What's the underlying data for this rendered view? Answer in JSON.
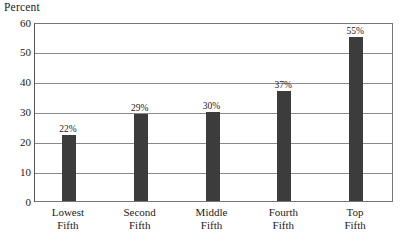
{
  "chart_data": {
    "type": "bar",
    "title": "",
    "ylabel": "Percent",
    "xlabel": "",
    "categories": [
      "Lowest Fifth",
      "Second Fifth",
      "Middle Fifth",
      "Fourth Fifth",
      "Top Fifth"
    ],
    "category_lines": [
      [
        "Lowest",
        "Fifth"
      ],
      [
        "Second",
        "Fifth"
      ],
      [
        "Middle",
        "Fifth"
      ],
      [
        "Fourth",
        "Fifth"
      ],
      [
        "Top",
        "Fifth"
      ]
    ],
    "values": [
      22,
      29,
      30,
      37,
      55
    ],
    "data_labels": [
      "22%",
      "29%",
      "30%",
      "37%",
      "55%"
    ],
    "ylim": [
      0,
      60
    ],
    "ytick_values": [
      60,
      50,
      40,
      30,
      20,
      10,
      0
    ],
    "ytick_labels": [
      "60",
      "50",
      "40",
      "30",
      "20",
      "10",
      "0"
    ],
    "grid": true,
    "legend": false,
    "bar_color": "#3c3c3c",
    "grid_color": "#8a8a8a",
    "frame_color": "#767676",
    "background_color": "#ffffff"
  }
}
